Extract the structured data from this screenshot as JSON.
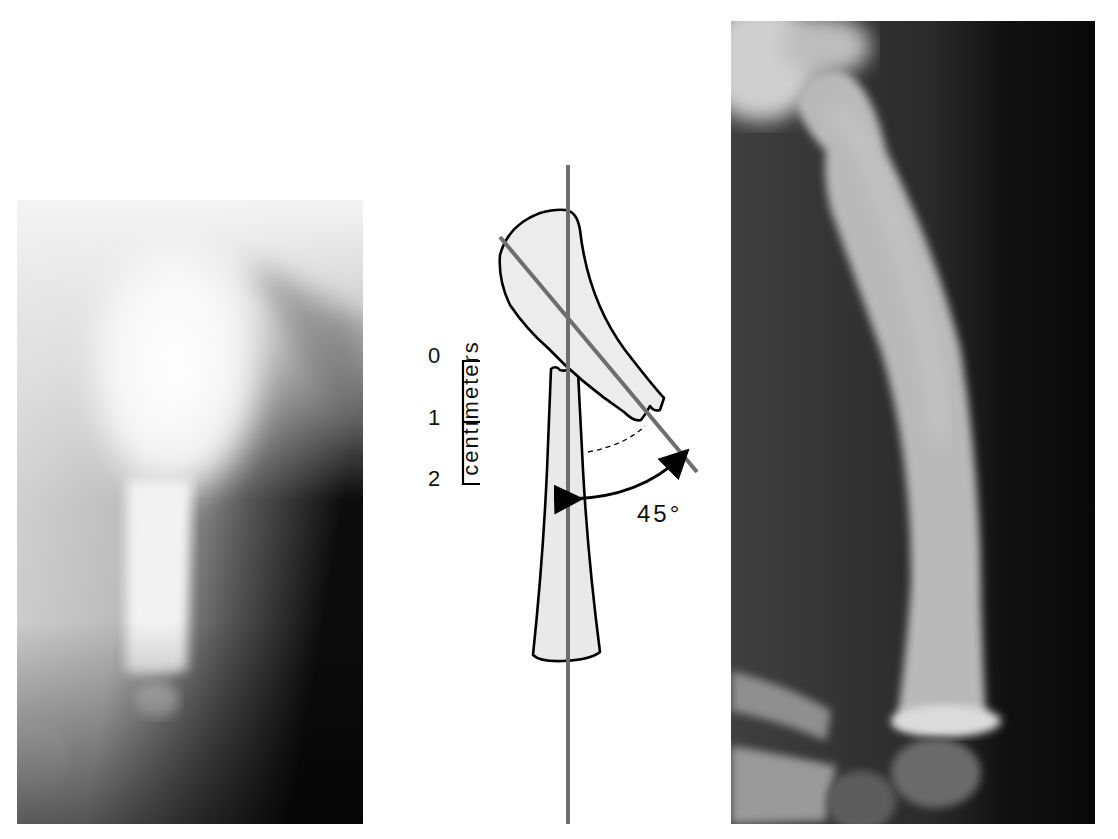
{
  "figure": {
    "panels": [
      {
        "id": "left",
        "description": "Radiograph of fractured bone with proximal fragment displaced (angulated)"
      },
      {
        "id": "center",
        "description": "Line diagram of fracture showing 45 degree angulation"
      },
      {
        "id": "right",
        "description": "Radiograph of healed bone showing bowed shaft"
      }
    ],
    "diagram": {
      "scale": {
        "title": "centimeters",
        "ticks": [
          "0",
          "1",
          "2"
        ],
        "unit": "cm"
      },
      "angle": {
        "label": "45°",
        "value": 45
      },
      "colors": {
        "axis_line": "#6e6e6e",
        "outline": "#000000",
        "bone_fill": "#e6e6e6"
      }
    }
  }
}
